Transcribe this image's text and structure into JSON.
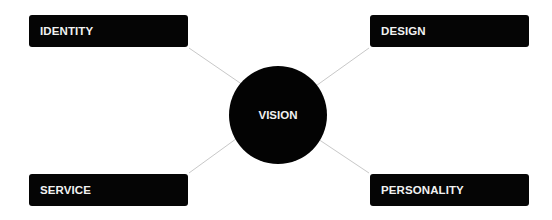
{
  "center": {
    "label": "VISION"
  },
  "nodes": {
    "top_left": {
      "label": "IDENTITY"
    },
    "top_right": {
      "label": "DESIGN"
    },
    "bottom_left": {
      "label": "SERVICE"
    },
    "bottom_right": {
      "label": "PERSONALITY"
    }
  },
  "colors": {
    "node_fill": "#050505",
    "text": "#f2f2f2",
    "connector": "#c8c8c8",
    "background": "#ffffff"
  }
}
